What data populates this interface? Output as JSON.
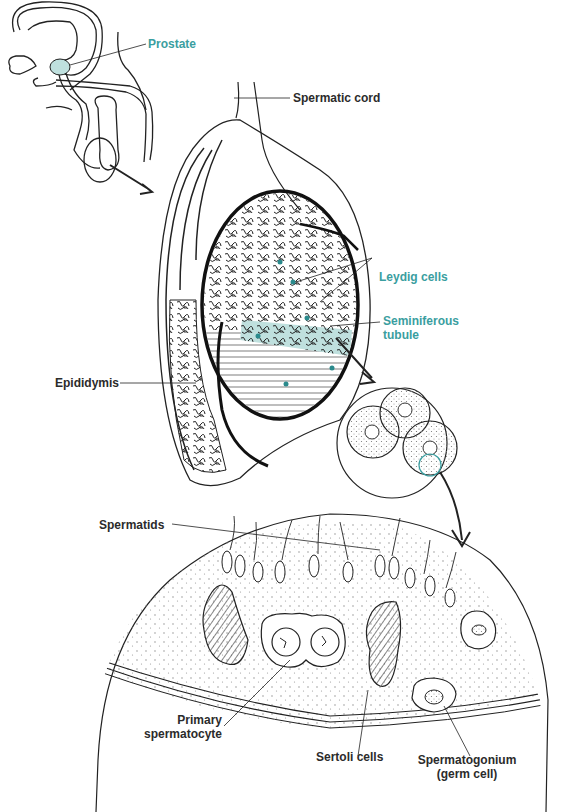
{
  "diagram": {
    "type": "anatomical-illustration",
    "colors": {
      "line": "#222222",
      "accent_teal": "#3a9ea0",
      "teal_fill": "#bfe0de",
      "dots": "#888888",
      "background": "#ffffff"
    },
    "panels": [
      {
        "id": "overview",
        "description": "male pelvic sagittal outline with prostate highlighted"
      },
      {
        "id": "testis",
        "description": "sectioned testis with epididymis and seminiferous tubules"
      },
      {
        "id": "tubule-cross-section",
        "description": "circular inset of three tubule cross-sections"
      },
      {
        "id": "epithelium",
        "description": "enlarged seminiferous epithelium segment"
      }
    ],
    "labels": {
      "prostate": "Prostate",
      "spermatic_cord": "Spermatic cord",
      "leydig_cells": "Leydig cells",
      "seminiferous_tubule_line1": "Seminiferous",
      "seminiferous_tubule_line2": "tubule",
      "epididymis": "Epididymis",
      "spermatids": "Spermatids",
      "primary_spermatocyte_line1": "Primary",
      "primary_spermatocyte_line2": "spermatocyte",
      "sertoli_cells": "Sertoli cells",
      "spermatogonium_line1": "Spermatogonium",
      "spermatogonium_line2": "(germ cell)"
    }
  }
}
